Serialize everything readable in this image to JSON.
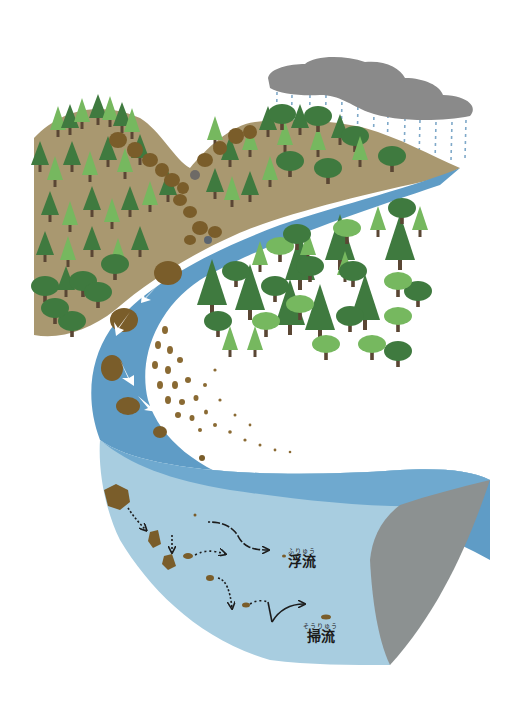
{
  "figure": {
    "title": ""
  },
  "labels": {
    "suspended_load": {
      "text": "浮流",
      "ruby": "ふりゅう"
    },
    "bed_load": {
      "text": "掃流",
      "ruby": "そうりゅう"
    }
  },
  "colors": {
    "sky": "#ffffff",
    "cloud": "#8a8a8a",
    "rain": "#7fa9c9",
    "mountain_soil": "#a99870",
    "river_surface": "#5f9cc6",
    "river_surface_light": "#7eb3d6",
    "water_cross_section": "#a8cde0",
    "riverbank_cut": "#8c9191",
    "rock": "#7a5d2a",
    "sediment": "#8a6a33",
    "tree_dark": "#3f7a3f",
    "tree_light": "#76b85f",
    "trunk": "#5a4634",
    "arrow_white": "#ffffff",
    "arrow_dark": "#1d1d1d"
  }
}
